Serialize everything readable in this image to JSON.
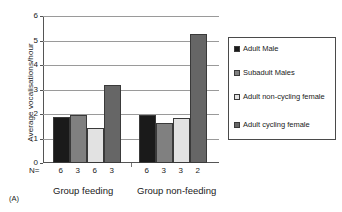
{
  "panel": {
    "caption": "(A)"
  },
  "chart_data": {
    "type": "bar",
    "title": "",
    "xlabel": "",
    "ylabel": "Average vocalisations/hour",
    "ylim": [
      0,
      6
    ],
    "yticks": [
      0,
      1,
      2,
      3,
      4,
      5,
      6
    ],
    "ytick_labels": [
      "0",
      "1",
      "2",
      "3",
      "4",
      "5",
      "6"
    ],
    "grid": true,
    "legend_position": "right",
    "categories": [
      "Group feeding",
      "Group non-feeding"
    ],
    "series": [
      {
        "name": "Adult Male",
        "color": "#1a1a1a",
        "values": [
          1.88,
          1.97
        ],
        "n": [
          6,
          6
        ]
      },
      {
        "name": "Subadult Males",
        "color": "#808080",
        "values": [
          1.98,
          1.63
        ],
        "n": [
          3,
          3
        ]
      },
      {
        "name": "Adult non-cycling female",
        "color": "#e2e2e2",
        "values": [
          1.44,
          1.83
        ],
        "n": [
          6,
          3
        ]
      },
      {
        "name": "Adult cycling female",
        "color": "#666666",
        "values": [
          3.17,
          5.25
        ],
        "n": [
          3,
          2
        ]
      }
    ],
    "n_row_label": "N=",
    "n_values": [
      6,
      3,
      6,
      3,
      6,
      3,
      3,
      2
    ]
  }
}
